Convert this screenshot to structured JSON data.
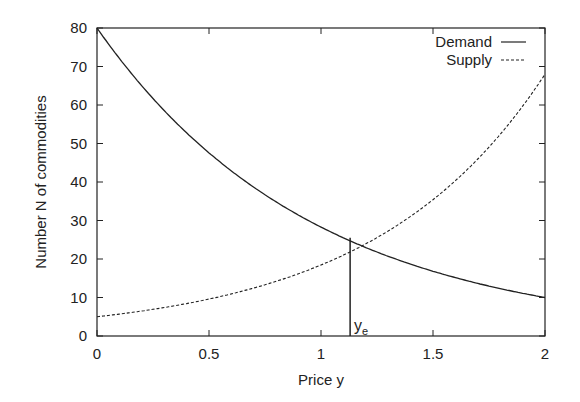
{
  "chart_data": {
    "type": "line",
    "title": "",
    "xlabel": "Price y",
    "ylabel": "Number N of commodities",
    "xlim": [
      0,
      2
    ],
    "ylim": [
      0,
      80
    ],
    "xticks": [
      "0",
      "0.5",
      "1",
      "1.5",
      "2"
    ],
    "yticks": [
      "0",
      "10",
      "20",
      "30",
      "40",
      "50",
      "60",
      "70",
      "80"
    ],
    "grid": false,
    "legend_position": "top-right",
    "series": [
      {
        "name": "Demand",
        "style": "solid",
        "x": [
          0,
          0.25,
          0.5,
          0.75,
          1.0,
          1.13,
          1.25,
          1.5,
          1.75,
          2.0
        ],
        "y": [
          80,
          62,
          48,
          37,
          29,
          25.5,
          23,
          18,
          13.5,
          10
        ]
      },
      {
        "name": "Supply",
        "style": "dashed",
        "x": [
          0,
          0.25,
          0.5,
          0.75,
          1.0,
          1.13,
          1.25,
          1.5,
          1.75,
          2.0
        ],
        "y": [
          5,
          7.5,
          11,
          15.5,
          21,
          25.5,
          29,
          38,
          51,
          68
        ]
      }
    ],
    "annotations": [
      {
        "type": "vline",
        "x": 1.13,
        "y_from": 0,
        "y_to": 25.5,
        "label": "y_e"
      }
    ]
  },
  "labels": {
    "legend_demand": "Demand",
    "legend_supply": "Supply",
    "ye_main": "y",
    "ye_sub": "e"
  }
}
